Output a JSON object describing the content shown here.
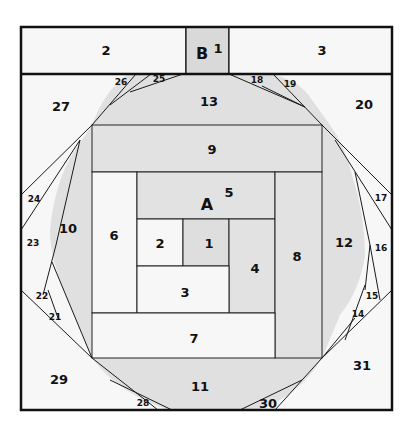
{
  "diagram": {
    "type": "foundation-paper-piecing-pattern",
    "colors": {
      "frame": "#111111",
      "line": "#1a1a1a",
      "white_fabric": "#f7f7f7",
      "light_gray_fabric": "#e2e2e2",
      "mid_gray_fabric": "#d6d6d6"
    },
    "sections": {
      "A": "A",
      "B": "B"
    },
    "section_b": {
      "pieces": [
        {
          "id": "b1",
          "label": "1"
        },
        {
          "id": "b2",
          "label": "2"
        },
        {
          "id": "b3",
          "label": "3"
        }
      ]
    },
    "section_a": {
      "pieces": [
        {
          "id": "a1",
          "label": "1"
        },
        {
          "id": "a2",
          "label": "2"
        },
        {
          "id": "a3",
          "label": "3"
        },
        {
          "id": "a4",
          "label": "4"
        },
        {
          "id": "a5",
          "label": "5"
        },
        {
          "id": "a6",
          "label": "6"
        },
        {
          "id": "a7",
          "label": "7"
        },
        {
          "id": "a8",
          "label": "8"
        },
        {
          "id": "a9",
          "label": "9"
        },
        {
          "id": "a10",
          "label": "10"
        },
        {
          "id": "a11",
          "label": "11"
        },
        {
          "id": "a12",
          "label": "12"
        },
        {
          "id": "a13",
          "label": "13"
        },
        {
          "id": "a14",
          "label": "14"
        },
        {
          "id": "a15",
          "label": "15"
        },
        {
          "id": "a16",
          "label": "16"
        },
        {
          "id": "a17",
          "label": "17"
        },
        {
          "id": "a18",
          "label": "18"
        },
        {
          "id": "a19",
          "label": "19"
        },
        {
          "id": "a20",
          "label": "20"
        },
        {
          "id": "a21",
          "label": "21"
        },
        {
          "id": "a22",
          "label": "22"
        },
        {
          "id": "a23",
          "label": "23"
        },
        {
          "id": "a24",
          "label": "24"
        },
        {
          "id": "a25",
          "label": "25"
        },
        {
          "id": "a26",
          "label": "26"
        },
        {
          "id": "a27",
          "label": "27"
        },
        {
          "id": "a28",
          "label": "28"
        },
        {
          "id": "a29",
          "label": "29"
        },
        {
          "id": "a30",
          "label": "30"
        },
        {
          "id": "a31",
          "label": "31"
        }
      ]
    }
  }
}
